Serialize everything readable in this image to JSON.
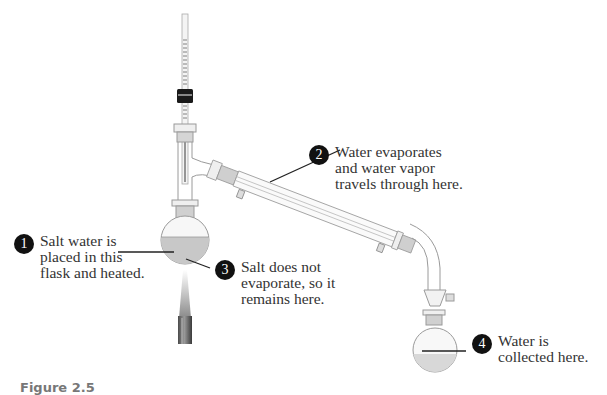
{
  "figure": {
    "caption": "Figure 2.5",
    "colors": {
      "glass_outline": "#9a9a9a",
      "liquid": "#c8c8c8",
      "badge": "#111111",
      "text": "#333333",
      "joint_ground_glass": "#bdbdbd",
      "thermometer_cap": "#1a1a1a"
    }
  },
  "callouts": [
    {
      "number": "1",
      "text": "Salt water is\nplaced in this\nflask and heated."
    },
    {
      "number": "2",
      "text": "Water evaporates\nand water vapor\ntravels through here."
    },
    {
      "number": "3",
      "text": "Salt does not\nevaporate, so it\nremains here."
    },
    {
      "number": "4",
      "text": "Water is\ncollected here."
    }
  ],
  "components": [
    {
      "name": "thermometer"
    },
    {
      "name": "distillation-head"
    },
    {
      "name": "boiling-flask"
    },
    {
      "name": "burner-flame"
    },
    {
      "name": "condenser"
    },
    {
      "name": "receiving-adapter"
    },
    {
      "name": "receiving-flask"
    }
  ]
}
